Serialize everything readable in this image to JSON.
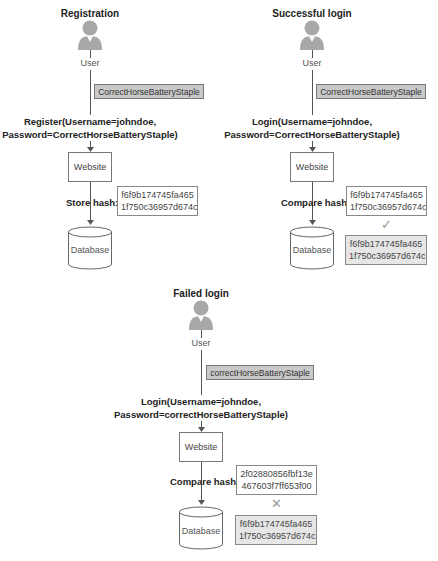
{
  "panels": [
    {
      "id": "registration",
      "title": "Registration",
      "actor": "User",
      "password_note": "CorrectHorseBatteryStaple",
      "message_line1": "Register(Username=johndoe,",
      "message_line2": "Password=CorrectHorseBatteryStaple)",
      "server": "Website",
      "hash_label": "Store hash:",
      "hash_line1": "f6f9b174745fa465",
      "hash_line2": "1f750c36957d674c",
      "database": "Database"
    },
    {
      "id": "successful-login",
      "title": "Successful login",
      "actor": "User",
      "password_note": "CorrectHorseBatteryStaple",
      "message_line1": "Login(Username=johndoe,",
      "message_line2": "Password=CorrectHorseBatteryStaple)",
      "server": "Website",
      "hash_label": "Compare hash:",
      "hash_line1": "f6f9b174745fa465",
      "hash_line2": "1f750c36957d674c",
      "comparison_mark": "✓",
      "stored_hash_line1": "f6f9b174745fa465",
      "stored_hash_line2": "1f750c36957d674c",
      "database": "Database"
    },
    {
      "id": "failed-login",
      "title": "Failed login",
      "actor": "User",
      "password_note": "correctHorseBatteryStaple",
      "message_line1": "Login(Username=johndoe,",
      "message_line2": "Password=correctHorseBatteryStaple)",
      "server": "Website",
      "hash_label": "Compare hash:",
      "hash_line1": "2f02880856fbf13e",
      "hash_line2": "467603f7ff653f00",
      "comparison_mark": "✕",
      "stored_hash_line1": "f6f9b174745fa465",
      "stored_hash_line2": "1f750c36957d674c",
      "database": "Database"
    }
  ],
  "icons": {
    "actor": "user-icon",
    "server": "website-box",
    "database": "database-cylinder-icon",
    "match": "checkmark-icon",
    "mismatch": "x-mark-icon"
  },
  "colors": {
    "note_fill": "#c9c9c9",
    "stored_hash_fill": "#e6e6e6",
    "line": "#555555",
    "user_icon": "#a8a8a8"
  }
}
